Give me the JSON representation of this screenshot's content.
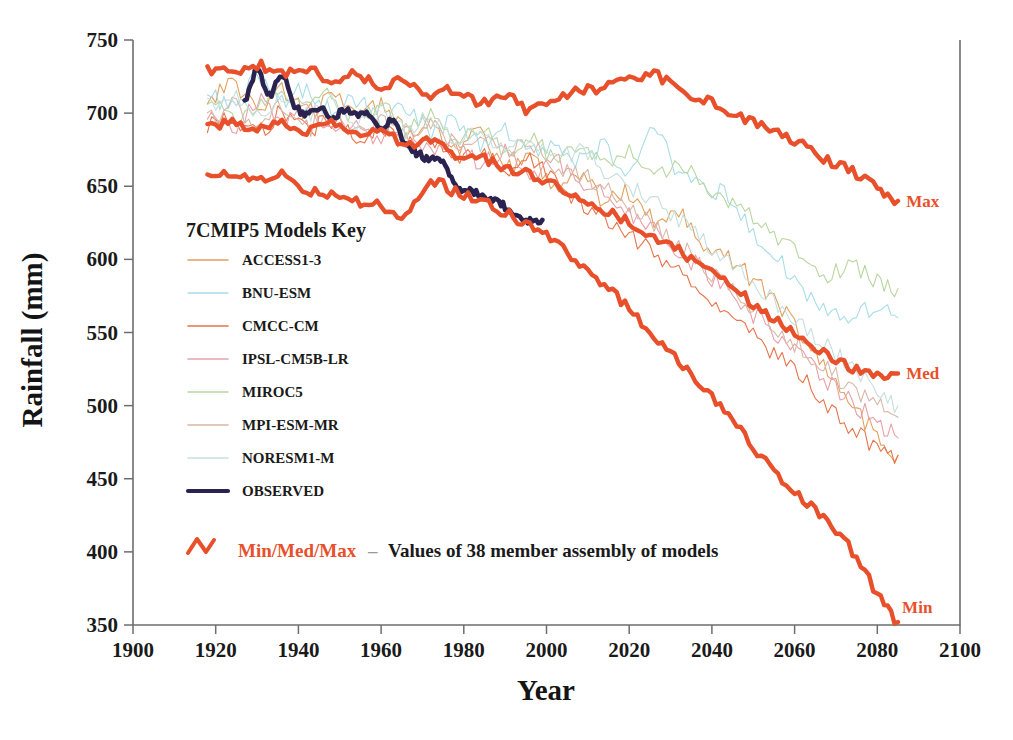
{
  "chart_data": {
    "type": "line",
    "title": "",
    "xlabel": "Year",
    "ylabel": "Rainfall  (mm)",
    "xlim": [
      1900,
      2100
    ],
    "ylim": [
      350,
      750
    ],
    "grid": false,
    "legend_position": "inside-left",
    "xticks": [
      1900,
      1920,
      1940,
      1960,
      1980,
      2000,
      2020,
      2040,
      2060,
      2080,
      2100
    ],
    "yticks": [
      350,
      400,
      450,
      500,
      550,
      600,
      650,
      700,
      750
    ],
    "edge_annotations": [
      {
        "name": "max-edge-label",
        "text": "Max",
        "year": 2087,
        "value": 640
      },
      {
        "name": "med-edge-label",
        "text": "Med",
        "year": 2087,
        "value": 522
      },
      {
        "name": "min-edge-label",
        "text": "Min",
        "year": 2086,
        "value": 362
      }
    ],
    "series": [
      {
        "name": "ACCESS1-3",
        "color": "#e2a05e",
        "width": 1.1,
        "x": [
          1918,
          1924,
          1930,
          1936,
          1942,
          1948,
          1954,
          1960,
          1966,
          1972,
          1978,
          1984,
          1990,
          1996,
          2002,
          2008,
          2014,
          2020,
          2026,
          2032,
          2038,
          2044,
          2050,
          2056,
          2062,
          2068,
          2074,
          2080,
          2085
        ],
        "values": [
          709,
          721,
          704,
          716,
          700,
          713,
          697,
          705,
          688,
          693,
          676,
          684,
          662,
          670,
          651,
          659,
          640,
          646,
          627,
          633,
          612,
          600,
          586,
          570,
          548,
          524,
          500,
          480,
          466
        ]
      },
      {
        "name": "BNU-ESM",
        "color": "#a8dde8",
        "width": 1.1,
        "x": [
          1918,
          1924,
          1930,
          1936,
          1942,
          1948,
          1954,
          1960,
          1966,
          1972,
          1978,
          1984,
          1990,
          1996,
          2002,
          2008,
          2014,
          2020,
          2026,
          2032,
          2038,
          2044,
          2050,
          2056,
          2062,
          2068,
          2074,
          2080,
          2085
        ],
        "values": [
          716,
          703,
          725,
          709,
          717,
          701,
          710,
          693,
          703,
          687,
          694,
          679,
          688,
          672,
          681,
          667,
          676,
          663,
          687,
          660,
          650,
          642,
          618,
          600,
          578,
          566,
          560,
          568,
          560
        ]
      },
      {
        "name": "CMCC-CM",
        "color": "#e8744a",
        "width": 1.1,
        "x": [
          1918,
          1924,
          1930,
          1936,
          1942,
          1948,
          1954,
          1960,
          1966,
          1972,
          1978,
          1984,
          1990,
          1996,
          2002,
          2008,
          2014,
          2020,
          2026,
          2032,
          2038,
          2044,
          2050,
          2056,
          2062,
          2068,
          2074,
          2080,
          2085
        ],
        "values": [
          691,
          697,
          686,
          700,
          689,
          696,
          683,
          691,
          678,
          684,
          670,
          676,
          661,
          667,
          652,
          640,
          629,
          618,
          604,
          592,
          578,
          563,
          548,
          534,
          518,
          500,
          484,
          470,
          466
        ]
      },
      {
        "name": "IPSL-CM5B-LR",
        "color": "#e8a0a8",
        "width": 1.1,
        "x": [
          1918,
          1924,
          1930,
          1936,
          1942,
          1948,
          1954,
          1960,
          1966,
          1972,
          1978,
          1984,
          1990,
          1996,
          2002,
          2008,
          2014,
          2020,
          2026,
          2032,
          2038,
          2044,
          2050,
          2056,
          2062,
          2068,
          2074,
          2080,
          2085
        ],
        "values": [
          701,
          688,
          710,
          694,
          702,
          688,
          696,
          680,
          690,
          674,
          682,
          666,
          674,
          660,
          668,
          652,
          646,
          632,
          620,
          606,
          592,
          576,
          562,
          546,
          532,
          516,
          502,
          490,
          478
        ]
      },
      {
        "name": "MIROC5",
        "color": "#b9d6a0",
        "width": 1.1,
        "x": [
          1918,
          1924,
          1930,
          1936,
          1942,
          1948,
          1954,
          1960,
          1966,
          1972,
          1978,
          1984,
          1990,
          1996,
          2002,
          2008,
          2014,
          2020,
          2026,
          2032,
          2038,
          2044,
          2050,
          2056,
          2062,
          2068,
          2074,
          2080,
          2085
        ],
        "values": [
          712,
          698,
          706,
          716,
          703,
          711,
          696,
          704,
          690,
          697,
          683,
          690,
          676,
          684,
          670,
          678,
          664,
          672,
          658,
          666,
          652,
          640,
          628,
          614,
          600,
          590,
          596,
          584,
          580
        ]
      },
      {
        "name": "MPI-ESM-MR",
        "color": "#d7b8a8",
        "width": 1.1,
        "x": [
          1918,
          1924,
          1930,
          1936,
          1942,
          1948,
          1954,
          1960,
          1966,
          1972,
          1978,
          1984,
          1990,
          1996,
          2002,
          2008,
          2014,
          2020,
          2026,
          2032,
          2038,
          2044,
          2050,
          2056,
          2062,
          2068,
          2074,
          2080,
          2085
        ],
        "values": [
          694,
          706,
          692,
          704,
          690,
          700,
          686,
          696,
          682,
          692,
          678,
          686,
          672,
          680,
          664,
          658,
          648,
          636,
          624,
          610,
          596,
          580,
          566,
          552,
          538,
          524,
          512,
          500,
          492
        ]
      },
      {
        "name": "NORESM1-M",
        "color": "#c5e0dd",
        "width": 1.1,
        "x": [
          1918,
          1924,
          1930,
          1936,
          1942,
          1948,
          1954,
          1960,
          1966,
          1972,
          1978,
          1984,
          1990,
          1996,
          2002,
          2008,
          2014,
          2020,
          2026,
          2032,
          2038,
          2044,
          2050,
          2056,
          2062,
          2068,
          2074,
          2080,
          2085
        ],
        "values": [
          705,
          714,
          700,
          712,
          698,
          708,
          694,
          702,
          688,
          696,
          682,
          689,
          676,
          682,
          668,
          674,
          660,
          650,
          640,
          628,
          614,
          600,
          584,
          570,
          556,
          540,
          526,
          512,
          500
        ]
      },
      {
        "name": "OBSERVED",
        "color": "#2a2350",
        "width": 4.6,
        "x": [
          1927,
          1930,
          1933,
          1936,
          1939,
          1942,
          1945,
          1948,
          1951,
          1954,
          1957,
          1960,
          1963,
          1966,
          1969,
          1972,
          1975,
          1978,
          1981,
          1984,
          1987,
          1990,
          1993,
          1996,
          1999
        ],
        "values": [
          707,
          730,
          712,
          727,
          706,
          700,
          704,
          697,
          702,
          698,
          700,
          690,
          694,
          679,
          672,
          668,
          666,
          650,
          647,
          644,
          640,
          636,
          629,
          626,
          627
        ]
      },
      {
        "name": "Max",
        "color": "#e8502b",
        "width": 4.4,
        "x": [
          1918,
          1924,
          1930,
          1936,
          1942,
          1948,
          1954,
          1960,
          1966,
          1972,
          1978,
          1984,
          1990,
          1996,
          2002,
          2008,
          2014,
          2020,
          2026,
          2032,
          2038,
          2044,
          2050,
          2056,
          2062,
          2068,
          2074,
          2080,
          2085
        ],
        "values": [
          730,
          728,
          733,
          726,
          731,
          722,
          727,
          718,
          722,
          712,
          716,
          706,
          712,
          702,
          710,
          715,
          718,
          722,
          726,
          716,
          710,
          700,
          694,
          686,
          678,
          668,
          660,
          650,
          640
        ]
      },
      {
        "name": "Med",
        "color": "#e8502b",
        "width": 4.4,
        "x": [
          1918,
          1924,
          1930,
          1936,
          1942,
          1948,
          1954,
          1960,
          1966,
          1972,
          1978,
          1984,
          1990,
          1996,
          2002,
          2008,
          2014,
          2020,
          2026,
          2032,
          2038,
          2044,
          2050,
          2056,
          2062,
          2068,
          2074,
          2080,
          2085
        ],
        "values": [
          691,
          694,
          689,
          693,
          688,
          692,
          686,
          690,
          678,
          680,
          672,
          670,
          662,
          658,
          650,
          642,
          634,
          626,
          616,
          606,
          594,
          582,
          570,
          558,
          546,
          534,
          526,
          520,
          522
        ]
      },
      {
        "name": "Min",
        "color": "#e8502b",
        "width": 4.4,
        "x": [
          1918,
          1924,
          1930,
          1936,
          1942,
          1948,
          1954,
          1960,
          1966,
          1972,
          1978,
          1984,
          1990,
          1996,
          2002,
          2008,
          2014,
          2020,
          2026,
          2032,
          2038,
          2044,
          2050,
          2056,
          2062,
          2068,
          2074,
          2080,
          2085
        ],
        "values": [
          657,
          660,
          655,
          659,
          648,
          645,
          640,
          636,
          630,
          652,
          646,
          640,
          632,
          622,
          612,
          598,
          582,
          566,
          548,
          530,
          512,
          492,
          472,
          452,
          436,
          420,
          400,
          372,
          352
        ]
      }
    ]
  },
  "legend": {
    "title": "7CMIP5 Models Key",
    "items": [
      {
        "label": "ACCESS1-3",
        "color": "#e2a05e",
        "width": 1.6
      },
      {
        "label": "BNU-ESM",
        "color": "#a8dde8",
        "width": 1.6
      },
      {
        "label": "CMCC-CM",
        "color": "#e8744a",
        "width": 1.6
      },
      {
        "label": "IPSL-CM5B-LR",
        "color": "#e8a0a8",
        "width": 1.6
      },
      {
        "label": "MIROC5",
        "color": "#b9d6a0",
        "width": 1.6
      },
      {
        "label": "MPI-ESM-MR",
        "color": "#d7b8a8",
        "width": 1.6
      },
      {
        "label": "NORESM1-M",
        "color": "#c5e0dd",
        "width": 1.6
      },
      {
        "label": "OBSERVED",
        "color": "#2a2350",
        "width": 4.2
      }
    ],
    "note": {
      "accent": "Min/Med/Max",
      "dash": "–",
      "text": "Values of 38 member assembly of models",
      "zigzag_color": "#e8502b"
    }
  }
}
